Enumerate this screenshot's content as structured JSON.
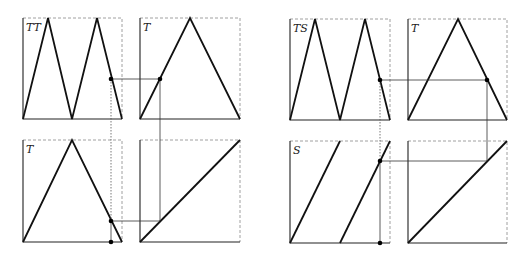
{
  "diagram": {
    "left_group": {
      "top_left": {
        "label": "TT",
        "curve": "double tent (two peaks)"
      },
      "top_right": {
        "label": "T",
        "curve": "tent map"
      },
      "bottom_left": {
        "label": "T",
        "curve": "tent map"
      },
      "bottom_right": {
        "label": "",
        "curve": "identity diagonal"
      }
    },
    "right_group": {
      "top_left": {
        "label": "TS",
        "curve": "double tent (two peaks)"
      },
      "top_right": {
        "label": "T",
        "curve": "tent map"
      },
      "bottom_left": {
        "label": "S",
        "curve": "doubling sawtooth"
      },
      "bottom_right": {
        "label": "",
        "curve": "identity diagonal"
      }
    },
    "colors": {
      "curve": "#111111",
      "frame": "#222222",
      "dashed_frame": "#888888",
      "link": "#333333"
    }
  }
}
